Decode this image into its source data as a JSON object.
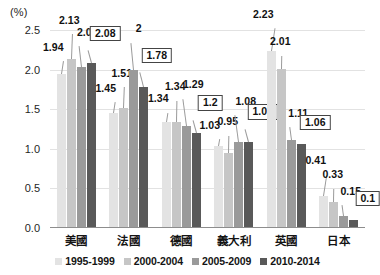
{
  "chart_data": {
    "type": "bar",
    "title": "",
    "subtitle": "",
    "xlabel": "",
    "ylabel": "(%)",
    "unit_label": "(%)",
    "ylim": [
      0,
      2.5
    ],
    "yticks": [
      "0.0",
      "0.5",
      "1.0",
      "1.5",
      "2.0",
      "2.5"
    ],
    "grid": true,
    "legend_position": "bottom",
    "categories": [
      "美國",
      "法國",
      "德國",
      "義大利",
      "英國",
      "日本"
    ],
    "series": [
      {
        "name": "1995-1999",
        "color": "#e3e3e3",
        "values": [
          1.94,
          1.45,
          1.34,
          1.03,
          2.23,
          0.41
        ],
        "labels": [
          "1.94",
          "1.45",
          "1.34",
          "1.03",
          "2.23",
          "0.41"
        ]
      },
      {
        "name": "2000-2004",
        "color": "#c6c6c6",
        "values": [
          2.13,
          1.51,
          1.34,
          0.95,
          2.01,
          0.33
        ],
        "labels": [
          "2.13",
          "1.51",
          "1.34",
          "0.95",
          "2.01",
          "0.33"
        ]
      },
      {
        "name": "2005-2009",
        "color": "#9a9a9a",
        "values": [
          2.03,
          2.0,
          1.29,
          1.08,
          1.11,
          0.15
        ],
        "labels": [
          "2.03",
          "2",
          "1.29",
          "1.08",
          "1.11",
          "0.15"
        ]
      },
      {
        "name": "2010-2014",
        "color": "#595959",
        "values": [
          2.08,
          1.78,
          1.2,
          1.09,
          1.06,
          0.1
        ],
        "labels": [
          "2.08",
          "1.78",
          "1.2",
          "1.09",
          "1.06",
          "0.1"
        ],
        "labels_boxed": true
      }
    ]
  },
  "legend": {
    "items": [
      {
        "label": "1995-1999"
      },
      {
        "label": "2000-2004"
      },
      {
        "label": "2005-2009"
      },
      {
        "label": "2010-2014"
      }
    ]
  }
}
